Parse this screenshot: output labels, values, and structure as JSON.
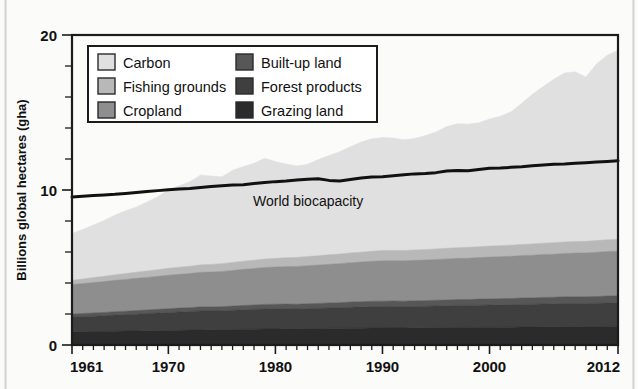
{
  "chart_data": {
    "type": "area",
    "title": "",
    "xlabel": "",
    "ylabel": "Billions global hectares (gha)",
    "xlim": [
      1961,
      2012
    ],
    "ylim": [
      0,
      20
    ],
    "grid": false,
    "legend_position": "top-left-inside",
    "y_ticks": [
      0,
      10,
      20
    ],
    "y_tick_labels": [
      "0",
      "10",
      "20"
    ],
    "y_minor_tick_step": 2,
    "x_ticks": [
      1961,
      1970,
      1980,
      1990,
      2000,
      2012
    ],
    "x_tick_labels": [
      "1961",
      "1970",
      "1980",
      "1990",
      "2000",
      "2012"
    ],
    "stacked": true,
    "x": [
      1961,
      1962,
      1963,
      1964,
      1965,
      1966,
      1967,
      1968,
      1969,
      1970,
      1971,
      1972,
      1973,
      1974,
      1975,
      1976,
      1977,
      1978,
      1979,
      1980,
      1981,
      1982,
      1983,
      1984,
      1985,
      1986,
      1987,
      1988,
      1989,
      1990,
      1991,
      1992,
      1993,
      1994,
      1995,
      1996,
      1997,
      1998,
      1999,
      2000,
      2001,
      2002,
      2003,
      2004,
      2005,
      2006,
      2007,
      2008,
      2009,
      2010,
      2011,
      2012
    ],
    "series": [
      {
        "name": "Grazing land",
        "color": "#2b2b2b",
        "stack_order": 1,
        "values": [
          0.85,
          0.86,
          0.87,
          0.88,
          0.89,
          0.9,
          0.91,
          0.92,
          0.93,
          0.94,
          0.95,
          0.96,
          0.97,
          0.98,
          0.99,
          1.0,
          1.01,
          1.02,
          1.03,
          1.04,
          1.05,
          1.05,
          1.06,
          1.06,
          1.07,
          1.07,
          1.08,
          1.08,
          1.09,
          1.09,
          1.1,
          1.1,
          1.11,
          1.11,
          1.12,
          1.12,
          1.13,
          1.13,
          1.14,
          1.14,
          1.15,
          1.15,
          1.16,
          1.16,
          1.17,
          1.17,
          1.18,
          1.18,
          1.19,
          1.19,
          1.2,
          1.2
        ]
      },
      {
        "name": "Forest products",
        "color": "#3f3f3f",
        "stack_order": 2,
        "values": [
          0.95,
          0.97,
          0.99,
          1.01,
          1.04,
          1.06,
          1.08,
          1.11,
          1.13,
          1.16,
          1.18,
          1.2,
          1.23,
          1.22,
          1.21,
          1.24,
          1.26,
          1.28,
          1.3,
          1.3,
          1.29,
          1.28,
          1.29,
          1.31,
          1.32,
          1.34,
          1.36,
          1.38,
          1.39,
          1.4,
          1.39,
          1.38,
          1.38,
          1.39,
          1.4,
          1.41,
          1.42,
          1.42,
          1.43,
          1.44,
          1.44,
          1.45,
          1.46,
          1.47,
          1.48,
          1.49,
          1.5,
          1.5,
          1.48,
          1.5,
          1.51,
          1.52
        ]
      },
      {
        "name": "Built-up land",
        "color": "#575757",
        "stack_order": 3,
        "values": [
          0.2,
          0.2,
          0.21,
          0.21,
          0.22,
          0.22,
          0.23,
          0.23,
          0.24,
          0.24,
          0.25,
          0.25,
          0.26,
          0.26,
          0.27,
          0.27,
          0.28,
          0.28,
          0.29,
          0.29,
          0.3,
          0.3,
          0.31,
          0.31,
          0.32,
          0.32,
          0.33,
          0.33,
          0.34,
          0.34,
          0.35,
          0.35,
          0.36,
          0.36,
          0.37,
          0.37,
          0.38,
          0.38,
          0.39,
          0.39,
          0.4,
          0.4,
          0.41,
          0.41,
          0.42,
          0.42,
          0.43,
          0.43,
          0.44,
          0.44,
          0.45,
          0.45
        ]
      },
      {
        "name": "Cropland",
        "color": "#8e8e8e",
        "stack_order": 4,
        "values": [
          1.9,
          1.93,
          1.96,
          1.99,
          2.02,
          2.05,
          2.08,
          2.1,
          2.13,
          2.16,
          2.18,
          2.2,
          2.23,
          2.25,
          2.28,
          2.3,
          2.33,
          2.35,
          2.38,
          2.4,
          2.42,
          2.44,
          2.46,
          2.48,
          2.5,
          2.52,
          2.54,
          2.56,
          2.58,
          2.6,
          2.6,
          2.6,
          2.61,
          2.62,
          2.63,
          2.65,
          2.66,
          2.67,
          2.68,
          2.7,
          2.71,
          2.72,
          2.74,
          2.75,
          2.77,
          2.78,
          2.8,
          2.82,
          2.83,
          2.85,
          2.87,
          2.88
        ]
      },
      {
        "name": "Fishing grounds",
        "color": "#b8b8b8",
        "stack_order": 5,
        "values": [
          0.28,
          0.3,
          0.32,
          0.34,
          0.36,
          0.38,
          0.4,
          0.42,
          0.43,
          0.45,
          0.46,
          0.47,
          0.48,
          0.49,
          0.5,
          0.52,
          0.53,
          0.54,
          0.55,
          0.56,
          0.57,
          0.58,
          0.59,
          0.6,
          0.61,
          0.62,
          0.63,
          0.64,
          0.65,
          0.66,
          0.66,
          0.67,
          0.67,
          0.68,
          0.68,
          0.69,
          0.69,
          0.7,
          0.7,
          0.71,
          0.71,
          0.72,
          0.72,
          0.73,
          0.73,
          0.74,
          0.74,
          0.75,
          0.75,
          0.76,
          0.76,
          0.77
        ]
      },
      {
        "name": "Carbon",
        "color": "#e0e0e0",
        "stack_order": 6,
        "values": [
          3.02,
          3.2,
          3.4,
          3.6,
          3.85,
          4.05,
          4.2,
          4.45,
          4.7,
          5.05,
          5.25,
          5.45,
          5.8,
          5.7,
          5.6,
          5.95,
          6.1,
          6.25,
          6.5,
          6.25,
          6.05,
          5.9,
          5.95,
          6.2,
          6.4,
          6.6,
          6.85,
          7.1,
          7.25,
          7.3,
          7.25,
          7.15,
          7.2,
          7.35,
          7.55,
          7.85,
          8.0,
          7.95,
          8.0,
          8.2,
          8.35,
          8.6,
          9.1,
          9.65,
          10.1,
          10.55,
          10.9,
          10.95,
          10.6,
          11.4,
          11.9,
          12.2
        ]
      }
    ],
    "reference_line": {
      "name": "World biocapacity",
      "label": "World biocapacity",
      "color": "#111111",
      "values": [
        9.55,
        9.6,
        9.64,
        9.68,
        9.72,
        9.78,
        9.84,
        9.9,
        9.96,
        10.02,
        10.06,
        10.1,
        10.16,
        10.22,
        10.28,
        10.32,
        10.34,
        10.42,
        10.48,
        10.54,
        10.58,
        10.64,
        10.7,
        10.72,
        10.62,
        10.58,
        10.68,
        10.78,
        10.84,
        10.86,
        10.92,
        10.98,
        11.04,
        11.06,
        11.12,
        11.22,
        11.26,
        11.24,
        11.32,
        11.4,
        11.42,
        11.46,
        11.5,
        11.56,
        11.62,
        11.66,
        11.68,
        11.72,
        11.76,
        11.8,
        11.84,
        11.88
      ]
    }
  },
  "legend": {
    "items": [
      {
        "label": "Carbon",
        "color": "#e0e0e0"
      },
      {
        "label": "Fishing grounds",
        "color": "#b8b8b8"
      },
      {
        "label": "Cropland",
        "color": "#8e8e8e"
      },
      {
        "label": "Built-up land",
        "color": "#575757"
      },
      {
        "label": "Forest products",
        "color": "#3f3f3f"
      },
      {
        "label": "Grazing land",
        "color": "#2b2b2b"
      }
    ]
  }
}
